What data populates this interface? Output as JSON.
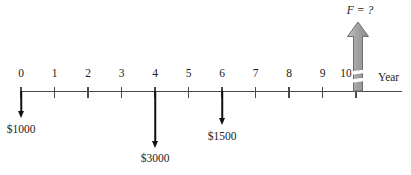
{
  "figure": {
    "axis": {
      "unit_label": "Year",
      "years": [
        "0",
        "1",
        "2",
        "3",
        "4",
        "5",
        "6",
        "7",
        "8",
        "9",
        "10"
      ],
      "line_color": "#4a4a4a"
    },
    "cash_flows": [
      {
        "year": 0,
        "label": "$1000",
        "direction": "down",
        "amount": 1000
      },
      {
        "year": 4,
        "label": "$3000",
        "direction": "down",
        "amount": 3000
      },
      {
        "year": 6,
        "label": "$1500",
        "direction": "down",
        "amount": 1500
      }
    ],
    "future_value": {
      "label": "F = ?",
      "year": 10,
      "direction": "up",
      "arrow_fill": "#a3a3a3",
      "arrow_fill_light": "#c6c6c6",
      "arrow_border": "#6e6e6e",
      "break_marks": 2
    }
  }
}
